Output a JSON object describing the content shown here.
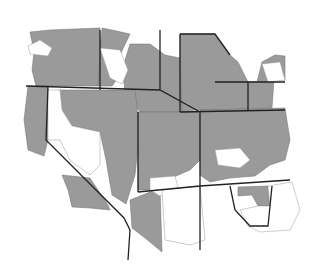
{
  "map": {
    "type": "choropleth",
    "region": "Western United States",
    "legend": [],
    "colors": {
      "shaded": "#9a9a9a",
      "unshaded": "#ffffff",
      "state_border": "#222222"
    }
  }
}
